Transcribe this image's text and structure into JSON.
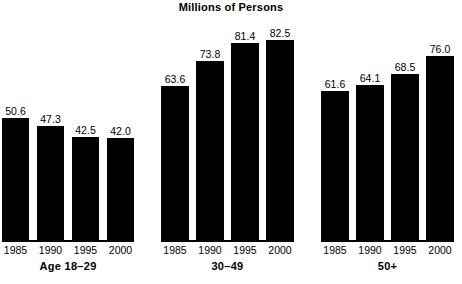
{
  "chart_data": {
    "type": "bar",
    "title": "Millions of Persons",
    "subtitle": "",
    "xlabel": "",
    "ylabel": "",
    "categories": [
      "1985",
      "1990",
      "1995",
      "2000"
    ],
    "ylim": [
      0,
      90
    ],
    "grid": false,
    "legend": "none",
    "bar_color": "#000000",
    "background_color": "#ffffff",
    "groups": [
      {
        "name": "Age 18-29",
        "label": "Age 18–29",
        "categories": [
          "1985",
          "1990",
          "1995",
          "2000"
        ],
        "values": [
          50.6,
          47.3,
          42.5,
          42.0
        ],
        "value_labels": [
          "50.6",
          "47.3",
          "42.5",
          "42.0"
        ]
      },
      {
        "name": "30-49",
        "label": "30–49",
        "categories": [
          "1985",
          "1990",
          "1995",
          "2000"
        ],
        "values": [
          63.6,
          73.8,
          81.4,
          82.5
        ],
        "value_labels": [
          "63.6",
          "73.8",
          "81.4",
          "82.5"
        ]
      },
      {
        "name": "50+",
        "label": "50+",
        "categories": [
          "1985",
          "1990",
          "1995",
          "2000"
        ],
        "values": [
          61.6,
          64.1,
          68.5,
          76.0
        ],
        "value_labels": [
          "61.6",
          "64.1",
          "68.5",
          "76.0"
        ]
      }
    ]
  },
  "layout": {
    "group_left": [
      2,
      161,
      321
    ],
    "group_width": [
      132,
      133,
      133
    ],
    "bar_width": 27,
    "bar_pitch": 35,
    "px_per_unit": 2.42
  }
}
